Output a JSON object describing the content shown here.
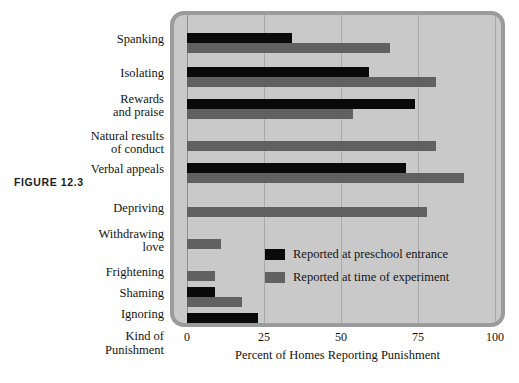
{
  "figure": {
    "label": "FIGURE  12.3"
  },
  "chart_data": {
    "type": "bar",
    "orientation": "horizontal",
    "title": "",
    "xlabel": "Percent of Homes Reporting Punishment",
    "ylabel": "Kind of\nPunishment",
    "ylabel_line1": "Kind of",
    "ylabel_line2": "Punishment",
    "xlim": [
      0,
      100
    ],
    "xticks": [
      0,
      25,
      50,
      75,
      100
    ],
    "xtick_labels": [
      "0",
      "25",
      "50",
      "75",
      "100"
    ],
    "grid": true,
    "legend_position": "center-right-inside",
    "categories": [
      "Spanking",
      "Isolating",
      "Rewards and praise",
      "Natural results of conduct",
      "Verbal appeals",
      "Depriving",
      "Withdrawing love",
      "Frightening",
      "Shaming",
      "Ignoring"
    ],
    "category_label_lines": [
      [
        "Spanking"
      ],
      [
        "Isolating"
      ],
      [
        "Rewards",
        "and praise"
      ],
      [
        "Natural results",
        "of conduct"
      ],
      [
        "Verbal appeals"
      ],
      [
        "Depriving"
      ],
      [
        "Withdrawing",
        "love"
      ],
      [
        "Frightening"
      ],
      [
        "Shaming"
      ],
      [
        "Ignoring"
      ]
    ],
    "series": [
      {
        "name": "Reported at preschool entrance",
        "color": "#0a0a0a",
        "values": [
          34,
          59,
          74,
          0,
          71,
          0,
          0,
          0,
          9,
          23
        ]
      },
      {
        "name": "Reported at time of experiment",
        "color": "#616161",
        "values": [
          66,
          81,
          54,
          81,
          90,
          78,
          11,
          9,
          18,
          0
        ]
      }
    ]
  },
  "legend": {
    "items": [
      {
        "label": "Reported at preschool entrance",
        "swatch": "dark"
      },
      {
        "label": "Reported at time of experiment",
        "swatch": "light"
      }
    ]
  },
  "colors": {
    "plot_background": "#c9c9c9",
    "plot_border": "#9b9b9b",
    "gridline": "#a9a9a9",
    "series_dark": "#0a0a0a",
    "series_light": "#616161",
    "page_background": "#ffffff",
    "text": "#141414"
  }
}
